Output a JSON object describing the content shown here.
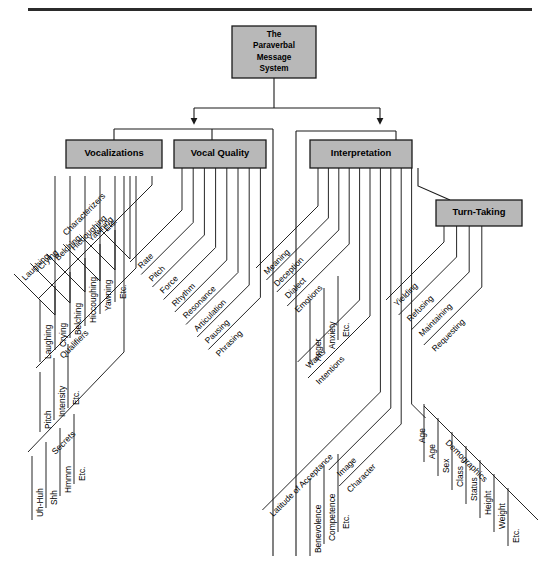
{
  "diagram": {
    "header_rule": true,
    "root": {
      "label": "The\nParaverbal\nMessage\nSystem",
      "lines": [
        "The",
        "Paraverbal",
        "Message",
        "System"
      ]
    },
    "colors": {
      "box_fill": "#b8b8b8",
      "box_stroke": "#1a1a1a",
      "line": "#1a1a1a",
      "text": "#000000",
      "page_bg": "#ffffff"
    },
    "boxes": [
      {
        "id": "vocalizations",
        "label": "Vocalizations"
      },
      {
        "id": "vocal-quality",
        "label": "Vocal Quality"
      },
      {
        "id": "interpretation",
        "label": "Interpretation"
      },
      {
        "id": "turn-taking",
        "label": "Turn-Taking"
      }
    ],
    "branches": [
      {
        "parent": "Vocalizations",
        "groups": [
          {
            "name": "Characterizers",
            "items": [
              "Laughing",
              "Crying",
              "Belching",
              "Hiccoughing",
              "Yawning",
              "Etc."
            ]
          },
          {
            "name": "Qualifiers",
            "items": [
              "Pitch",
              "Intensity",
              "Etc."
            ]
          },
          {
            "name": "Secrets",
            "items": [
              "Uh-Huh",
              "Shh",
              "Hmmm",
              "Etc."
            ]
          }
        ]
      },
      {
        "parent": "Vocal Quality",
        "groups": [
          {
            "name": "",
            "items": [
              "Rate",
              "Pitch",
              "Force",
              "Rhythm",
              "Resonance",
              "Articulation",
              "Pausing",
              "Phrasing"
            ]
          }
        ]
      },
      {
        "parent": "Interpretation",
        "groups": [
          {
            "name": "",
            "items": [
              "Meaning",
              "Deception",
              "Dialect",
              "Emotions",
              "Wants",
              "Intentions",
              "Latitude of Acceptance",
              "Image",
              "Character",
              "Age"
            ]
          },
          {
            "name": "Emotions",
            "items": [
              "Anger",
              "Anxiety",
              "Etc."
            ]
          },
          {
            "name": "Character",
            "items": [
              "Benevolence",
              "Competence",
              "Etc."
            ]
          },
          {
            "name": "Demographics",
            "items": [
              "Age",
              "Sex",
              "Class",
              "Status",
              "Height",
              "Weight",
              "Etc."
            ]
          }
        ]
      },
      {
        "parent": "Turn-Taking",
        "groups": [
          {
            "name": "",
            "items": [
              "Yielding",
              "Refusing",
              "Maintaining",
              "Requesting"
            ]
          }
        ]
      }
    ],
    "labels": {
      "vocalizations_characterizers": [
        "Laughing",
        "Crying",
        "Belching",
        "Hiccoughing",
        "Yawning",
        "Etc."
      ],
      "vocalizations_characterizers_head": "Characterizers",
      "vocalizations_qualifiers": [
        "Pitch",
        "Intensity",
        "Etc."
      ],
      "vocalizations_qualifiers_head": "Qualifiers",
      "vocalizations_secrets": [
        "Uh-Huh",
        "Shh",
        "Hmmm",
        "Etc."
      ],
      "vocalizations_secrets_head": "Secrets",
      "vocal_quality": [
        "Rate",
        "Pitch",
        "Force",
        "Rhythm",
        "Resonance",
        "Articulation",
        "Pausing",
        "Phrasing"
      ],
      "interpretation_main": [
        "Meaning",
        "Deception",
        "Dialect",
        "Emotions",
        "Wants",
        "Intentions",
        "Latitude of Acceptance",
        "Image",
        "Character"
      ],
      "interpretation_emotions": [
        "Anger",
        "Anxiety",
        "Etc."
      ],
      "interpretation_character": [
        "Benevolence",
        "Competence",
        "Etc."
      ],
      "turn_taking": [
        "Yielding",
        "Refusing",
        "Maintaining",
        "Requesting"
      ],
      "demographics_head": "Demographics",
      "demographics": [
        "Age",
        "Sex",
        "Class",
        "Status",
        "Height",
        "Weight",
        "Etc."
      ],
      "age_standalone": "Age"
    }
  }
}
